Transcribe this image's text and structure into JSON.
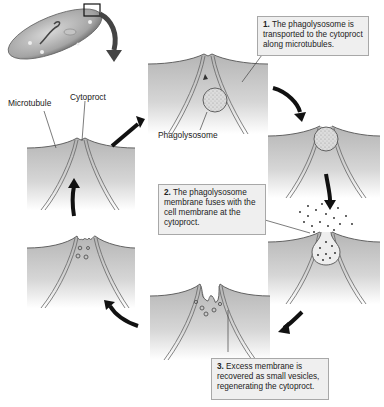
{
  "diagram": {
    "title": "",
    "colors": {
      "cytoplasm_top": "#b7b7b7",
      "cytoplasm_bottom": "#ffffff",
      "arrow": "#111111",
      "callout_bg": "#efefef",
      "callout_border": "#a8a8a8",
      "vacuole_fill": "#d9d9d9"
    },
    "labels": {
      "microtubule": "Microtubule",
      "cytoproct": "Cytoproct",
      "phagolysosome": "Phagolysosome"
    },
    "steps": [
      {
        "number": "1.",
        "text": " The phagolysosome is transported to the cytoproct along microtubules."
      },
      {
        "number": "2.",
        "text": " The phagolysosome membrane fuses with the cell membrane at the cytoproct."
      },
      {
        "number": "3.",
        "text": " Excess membrane is recovered as small vesicles, regenerating the cytoproct."
      }
    ],
    "panels": [
      {
        "id": "start",
        "description": "cytoproct with microtubules"
      },
      {
        "id": "transport",
        "description": "phagolysosome moving along microtubules"
      },
      {
        "id": "arrival",
        "description": "phagolysosome at cytoproct"
      },
      {
        "id": "fusion",
        "description": "contents expelled"
      },
      {
        "id": "recovery",
        "description": "membrane folding into vesicles"
      },
      {
        "id": "regenerated",
        "description": "small vesicles near cytoproct"
      }
    ],
    "inset": {
      "description": "paramecium cell with highlighted cytoproct region"
    }
  }
}
